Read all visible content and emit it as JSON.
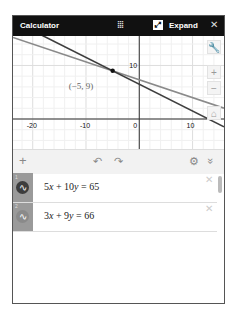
{
  "header": {
    "title": "Calculator",
    "drag_icon": "grip-dots-icon",
    "expand_label": "Expand",
    "expand_icon": "expand-arrows-icon",
    "close_icon": "close-icon"
  },
  "graph": {
    "xlim": [
      -23.7,
      15.9
    ],
    "ylim": [
      -5.6,
      15.5
    ],
    "x_ticks": [
      "-20",
      "-10",
      "0",
      "10"
    ],
    "x_tick_values": [
      -20,
      -10,
      0,
      10
    ],
    "y_ticks": [
      "10"
    ],
    "y_tick_values": [
      10
    ],
    "intersection": {
      "x": -5,
      "y": 9,
      "label": "(−5, 9)"
    },
    "lines": [
      {
        "a": 5,
        "b": 10,
        "c": 65,
        "color": "#3d3d3d"
      },
      {
        "a": 3,
        "b": 9,
        "c": 66,
        "color": "#8a8a8a"
      }
    ],
    "buttons": {
      "settings": "wrench-icon",
      "zoom_in": "+",
      "zoom_out": "−",
      "home": "home-icon"
    }
  },
  "toolbar": {
    "add": "+",
    "undo": "↶",
    "redo": "↷",
    "settings": "⚙",
    "collapse": "»"
  },
  "expressions": [
    {
      "num": "1",
      "text_html": "5<i>x</i> + 10<i>y</i> = 65",
      "color": "#3d3d3d"
    },
    {
      "num": "2",
      "text_html": "3<i>x</i> + 9<i>y</i> = 66",
      "color": "#8a8a8a"
    }
  ]
}
